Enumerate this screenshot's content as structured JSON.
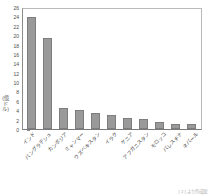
{
  "chart_data": {
    "type": "bar",
    "title": "",
    "xlabel": "",
    "ylabel": "(億ドル)",
    "ylim": [
      0,
      26
    ],
    "ytick_step": 2,
    "yticks": [
      26,
      24,
      22,
      20,
      18,
      16,
      14,
      12,
      10,
      8,
      6,
      4,
      2,
      0
    ],
    "grid": false,
    "legend": "none",
    "bar_color": "#9a9a9a",
    "categories": [
      "インド",
      "バングラデシュ",
      "カンボジア",
      "ミャンマー",
      "ウズベキスタン",
      "イラク",
      "ケニア",
      "アフガニスタン",
      "モロッコ",
      "パレスチナ",
      "ネパール"
    ],
    "values": [
      23.8,
      19.5,
      4.5,
      4.0,
      3.5,
      2.9,
      2.3,
      2.2,
      1.5,
      1.0,
      1.0
    ]
  },
  "axis": {
    "y_unit_label": "(億ドル)"
  },
  "footer": {
    "source_note": "[ 2 ] より作成図"
  }
}
